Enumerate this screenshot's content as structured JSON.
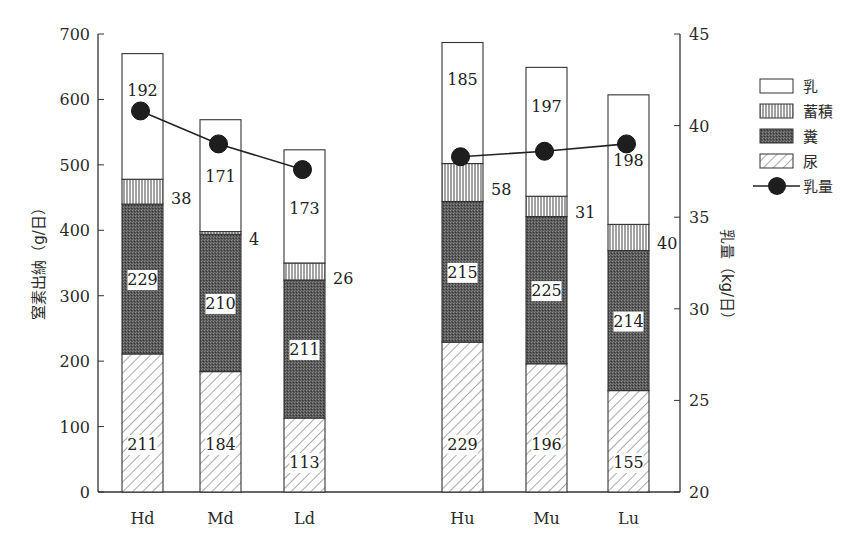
{
  "chart_data": {
    "type": "bar",
    "subtype": "stacked-bar-with-line-secondary-axis",
    "title": "",
    "categories": [
      "Hd",
      "Md",
      "Ld",
      "Hu",
      "Mu",
      "Lu"
    ],
    "series": [
      {
        "name": "尿",
        "pattern": "diagonal-hatch",
        "values": [
          211,
          184,
          113,
          229,
          196,
          155
        ]
      },
      {
        "name": "糞",
        "pattern": "dark-stipple",
        "values": [
          229,
          210,
          211,
          215,
          225,
          214
        ]
      },
      {
        "name": "蓄積",
        "pattern": "vertical-lines",
        "values": [
          38,
          4,
          26,
          58,
          31,
          40
        ]
      },
      {
        "name": "乳",
        "pattern": "white",
        "values": [
          192,
          171,
          173,
          185,
          197,
          198
        ]
      }
    ],
    "line_series": {
      "name": "乳量",
      "axis": "right",
      "values": [
        40.8,
        39.0,
        37.6,
        38.3,
        38.6,
        39.0
      ]
    },
    "ylabel": "窒素出納（g/日）",
    "ylabel_right": "乳量（kg/日）",
    "xlabel": "",
    "ylim": [
      0,
      700
    ],
    "yticks": [
      0,
      100,
      200,
      300,
      400,
      500,
      600,
      700
    ],
    "ylim_right": [
      20,
      45
    ],
    "yticks_right": [
      20,
      25,
      30,
      35,
      40,
      45
    ],
    "grid": false,
    "legend_position": "right-top",
    "legend": [
      "乳",
      "蓄積",
      "糞",
      "尿",
      "乳量"
    ]
  }
}
